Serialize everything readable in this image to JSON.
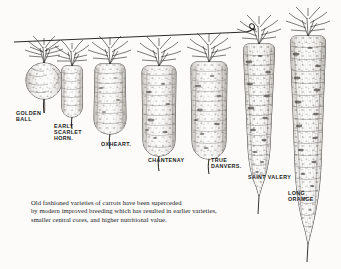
{
  "plate": {
    "title": "Old fashioned carrot varieties comparison plate",
    "background_color": "#fcfbf9",
    "ink_color": "#1b1b1b"
  },
  "varieties": [
    {
      "id": "golden-ball",
      "label": "GOLDEN\nBALL",
      "shape": "round",
      "label_x": 16,
      "label_y": 110
    },
    {
      "id": "early-scarlet-horn",
      "label": "EARLY\nSCARLET\nHORN.",
      "shape": "short-blunt",
      "label_x": 54,
      "label_y": 123
    },
    {
      "id": "oxheart",
      "label": "OXHEART.",
      "shape": "conical-broad",
      "label_x": 101,
      "label_y": 141
    },
    {
      "id": "chantenay",
      "label": "CHANTENAY",
      "shape": "tapered-stump",
      "label_x": 148,
      "label_y": 157
    },
    {
      "id": "true-danvers",
      "label": "TRUE\nDANVERS.",
      "shape": "long-tapered",
      "label_x": 211,
      "label_y": 157
    },
    {
      "id": "saint-valery",
      "label": "SAINT VALERY",
      "shape": "very-long",
      "label_x": 248,
      "label_y": 174
    },
    {
      "id": "long-orange",
      "label": "LONG\nORANGE",
      "shape": "longest",
      "label_x": 288,
      "label_y": 190
    }
  ],
  "caption": {
    "line1": "Old fashioned varieties of carrots have been superceded",
    "line2": "by modern improved breeding which has resulted in earlier varieties,",
    "line3": "smaller central cores, and higher nutritional value."
  },
  "groundline": {
    "name": "ground-line",
    "description": "horizontal rule across tops of carrots with curled right end"
  }
}
